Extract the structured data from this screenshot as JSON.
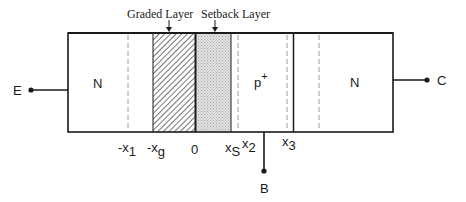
{
  "annotations": {
    "graded_layer": "Graded Layer",
    "setback_layer": "Setback Layer"
  },
  "regions": {
    "emitter": "N",
    "base": "p",
    "base_superscript": "+",
    "collector": "N"
  },
  "terminals": {
    "emitter": "E",
    "base": "B",
    "collector": "C"
  },
  "axis_labels": {
    "neg_x1": {
      "prefix": "-x",
      "sub": "1"
    },
    "neg_xg": {
      "prefix": "-x",
      "sub": "g"
    },
    "zero": "0",
    "xs": {
      "prefix": "x",
      "sub": "S"
    },
    "x2": {
      "prefix": "x",
      "sub": "2"
    },
    "x3": {
      "prefix": "x",
      "sub": "3"
    }
  },
  "colors": {
    "stroke": "#1a1a1a",
    "dashed": "#9a9a9a",
    "hatch": "#3a3a3a",
    "stipple": "#c8c8c8"
  }
}
